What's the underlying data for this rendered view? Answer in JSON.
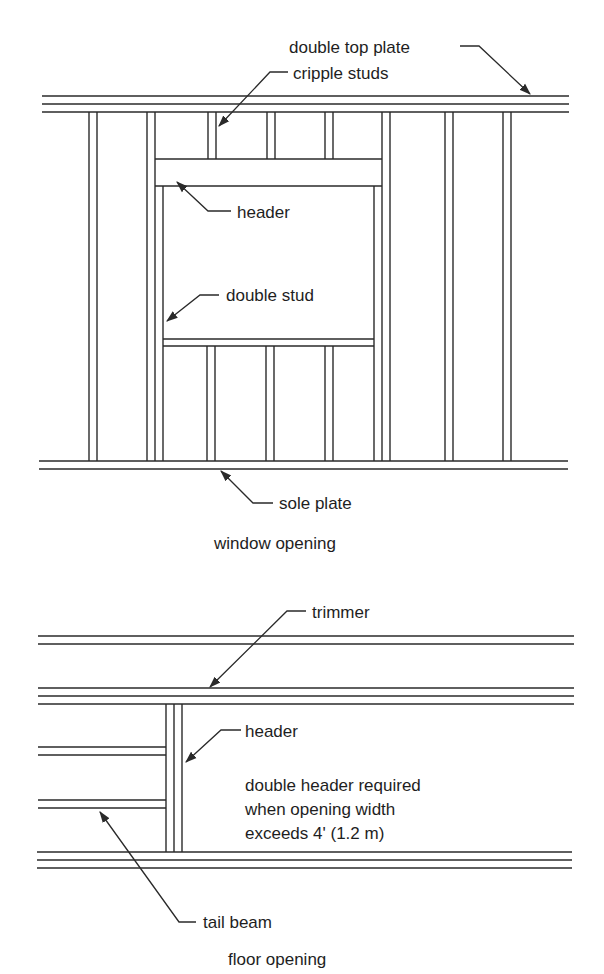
{
  "window_opening": {
    "caption": "window opening",
    "labels": {
      "double_top_plate": "double top plate",
      "cripple_studs": "cripple studs",
      "header": "header",
      "double_stud": "double stud",
      "sole_plate": "sole plate"
    }
  },
  "floor_opening": {
    "caption": "floor opening",
    "labels": {
      "trimmer": "trimmer",
      "header": "header",
      "tail_beam": "tail beam"
    },
    "note": [
      "double header required",
      "when opening width",
      "exceeds 4' (1.2 m)"
    ]
  },
  "colors": {
    "line": "#2a2a2a",
    "text": "#1e1e1e",
    "background": "#ffffff"
  }
}
